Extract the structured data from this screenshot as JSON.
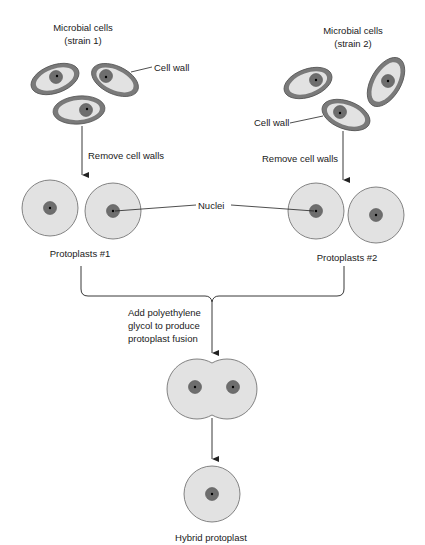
{
  "title": "Protoplast fusion",
  "labels": {
    "strain1_line1": "Microbial cells",
    "strain1_line2": "(strain 1)",
    "strain2_line1": "Microbial cells",
    "strain2_line2": "(strain 2)",
    "cell_wall_1": "Cell wall",
    "cell_wall_2": "Cell wall",
    "remove_walls_1": "Remove cell walls",
    "remove_walls_2": "Remove cell walls",
    "nuclei": "Nuclei",
    "protoplasts_1": "Protoplasts #1",
    "protoplasts_2": "Protoplasts #2",
    "fusion_line1": "Add polyethylene",
    "fusion_line2": "glycol to produce",
    "fusion_line3": "protoplast fusion",
    "hybrid": "Hybrid protoplast"
  },
  "colors": {
    "cell_wall": "#7a7a7a",
    "cytoplasm": "#e2e2e2",
    "nucleus": "#6e6e6e",
    "outline": "#555555",
    "line": "#222222"
  }
}
